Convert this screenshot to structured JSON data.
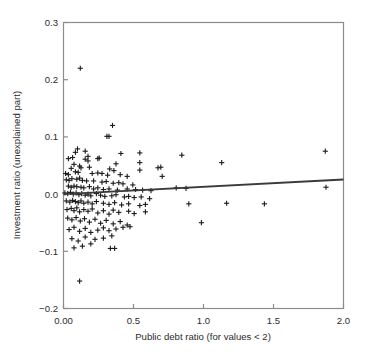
{
  "chart_data": {
    "type": "scatter",
    "title": "",
    "xlabel": "Public debt ratio (for values < 2)",
    "ylabel": "Investment ratio (unexplained part)",
    "xlim": [
      0.0,
      2.0
    ],
    "ylim": [
      -0.2,
      0.3
    ],
    "grid": false,
    "legend": null,
    "xticks": [
      0.0,
      0.5,
      1.0,
      1.5,
      2.0
    ],
    "xticklabels": [
      "0.00",
      "0.5",
      "1.0",
      "1.5",
      "2.0"
    ],
    "yticks": [
      -0.2,
      -0.1,
      0.0,
      0.1,
      0.2,
      0.3
    ],
    "yticklabels": [
      "-0.2",
      "-0.1",
      "0.0",
      "0.1",
      "0.2",
      "0.3"
    ],
    "marker": "plus",
    "marker_color": "#1a1a1a",
    "frame_color": "#8c8c8c",
    "series": [
      {
        "name": "observations",
        "points": [
          [
            0.12,
            0.22
          ],
          [
            0.35,
            0.12
          ],
          [
            0.31,
            0.101
          ],
          [
            0.325,
            0.101
          ],
          [
            0.085,
            0.073
          ],
          [
            0.1,
            0.079
          ],
          [
            0.155,
            0.075
          ],
          [
            0.175,
            0.066
          ],
          [
            0.41,
            0.071
          ],
          [
            0.545,
            0.072
          ],
          [
            0.845,
            0.068
          ],
          [
            1.87,
            0.075
          ],
          [
            0.035,
            0.062
          ],
          [
            0.065,
            0.064
          ],
          [
            0.155,
            0.061
          ],
          [
            0.175,
            0.058
          ],
          [
            0.245,
            0.062
          ],
          [
            0.255,
            0.063
          ],
          [
            0.375,
            0.053
          ],
          [
            0.545,
            0.055
          ],
          [
            1.13,
            0.055
          ],
          [
            0.055,
            0.045
          ],
          [
            0.075,
            0.052
          ],
          [
            0.115,
            0.049
          ],
          [
            0.125,
            0.046
          ],
          [
            0.185,
            0.047
          ],
          [
            0.33,
            0.044
          ],
          [
            0.36,
            0.041
          ],
          [
            0.545,
            0.042
          ],
          [
            0.675,
            0.046
          ],
          [
            0.695,
            0.047
          ],
          [
            0.015,
            0.036
          ],
          [
            0.035,
            0.034
          ],
          [
            0.085,
            0.039
          ],
          [
            0.105,
            0.038
          ],
          [
            0.205,
            0.036
          ],
          [
            0.245,
            0.037
          ],
          [
            0.275,
            0.036
          ],
          [
            0.315,
            0.033
          ],
          [
            0.405,
            0.034
          ],
          [
            0.455,
            0.031
          ],
          [
            0.705,
            0.031
          ],
          [
            0.02,
            0.025
          ],
          [
            0.04,
            0.024
          ],
          [
            0.06,
            0.027
          ],
          [
            0.095,
            0.026
          ],
          [
            0.115,
            0.028
          ],
          [
            0.135,
            0.024
          ],
          [
            0.165,
            0.023
          ],
          [
            0.215,
            0.023
          ],
          [
            0.275,
            0.021
          ],
          [
            0.305,
            0.022
          ],
          [
            0.355,
            0.019
          ],
          [
            0.395,
            0.02
          ],
          [
            0.425,
            0.018
          ],
          [
            0.495,
            0.016
          ],
          [
            0.035,
            0.014
          ],
          [
            0.055,
            0.012
          ],
          [
            0.075,
            0.014
          ],
          [
            0.095,
            0.013
          ],
          [
            0.125,
            0.012
          ],
          [
            0.145,
            0.011
          ],
          [
            0.185,
            0.013
          ],
          [
            0.215,
            0.009
          ],
          [
            0.245,
            0.011
          ],
          [
            0.285,
            0.008
          ],
          [
            0.325,
            0.009
          ],
          [
            0.385,
            0.007
          ],
          [
            0.455,
            0.009
          ],
          [
            0.515,
            0.008
          ],
          [
            0.565,
            0.007
          ],
          [
            0.625,
            0.006
          ],
          [
            0.805,
            0.011
          ],
          [
            0.875,
            0.01
          ],
          [
            1.875,
            0.012
          ],
          [
            0.01,
            0.002
          ],
          [
            0.03,
            0.001
          ],
          [
            0.05,
            0.003
          ],
          [
            0.07,
            0.0
          ],
          [
            0.09,
            0.002
          ],
          [
            0.11,
            -0.001
          ],
          [
            0.13,
            0.001
          ],
          [
            0.155,
            -0.002
          ],
          [
            0.175,
            0.0
          ],
          [
            0.195,
            -0.003
          ],
          [
            0.235,
            0.001
          ],
          [
            0.265,
            -0.002
          ],
          [
            0.295,
            -0.004
          ],
          [
            0.345,
            -0.003
          ],
          [
            0.375,
            -0.001
          ],
          [
            0.435,
            -0.005
          ],
          [
            0.465,
            -0.004
          ],
          [
            0.505,
            -0.006
          ],
          [
            0.555,
            -0.005
          ],
          [
            0.615,
            -0.008
          ],
          [
            0.02,
            -0.012
          ],
          [
            0.045,
            -0.014
          ],
          [
            0.065,
            -0.011
          ],
          [
            0.085,
            -0.013
          ],
          [
            0.105,
            -0.015
          ],
          [
            0.125,
            -0.012
          ],
          [
            0.145,
            -0.016
          ],
          [
            0.175,
            -0.014
          ],
          [
            0.205,
            -0.017
          ],
          [
            0.235,
            -0.013
          ],
          [
            0.285,
            -0.016
          ],
          [
            0.325,
            -0.018
          ],
          [
            0.365,
            -0.015
          ],
          [
            0.415,
            -0.019
          ],
          [
            0.465,
            -0.017
          ],
          [
            0.545,
            -0.02
          ],
          [
            0.585,
            -0.018
          ],
          [
            0.895,
            -0.017
          ],
          [
            1.165,
            -0.016
          ],
          [
            1.435,
            -0.017
          ],
          [
            0.025,
            -0.027
          ],
          [
            0.055,
            -0.025
          ],
          [
            0.075,
            -0.029
          ],
          [
            0.095,
            -0.024
          ],
          [
            0.115,
            -0.031
          ],
          [
            0.145,
            -0.027
          ],
          [
            0.175,
            -0.03
          ],
          [
            0.205,
            -0.026
          ],
          [
            0.245,
            -0.033
          ],
          [
            0.285,
            -0.029
          ],
          [
            0.325,
            -0.035
          ],
          [
            0.355,
            -0.028
          ],
          [
            0.395,
            -0.032
          ],
          [
            0.465,
            -0.03
          ],
          [
            0.505,
            -0.034
          ],
          [
            0.585,
            -0.031
          ],
          [
            0.03,
            -0.042
          ],
          [
            0.06,
            -0.045
          ],
          [
            0.09,
            -0.041
          ],
          [
            0.12,
            -0.047
          ],
          [
            0.15,
            -0.043
          ],
          [
            0.185,
            -0.049
          ],
          [
            0.225,
            -0.044
          ],
          [
            0.265,
            -0.051
          ],
          [
            0.305,
            -0.046
          ],
          [
            0.355,
            -0.052
          ],
          [
            0.405,
            -0.048
          ],
          [
            0.455,
            -0.054
          ],
          [
            0.985,
            -0.05
          ],
          [
            0.04,
            -0.062
          ],
          [
            0.075,
            -0.058
          ],
          [
            0.115,
            -0.065
          ],
          [
            0.155,
            -0.06
          ],
          [
            0.195,
            -0.067
          ],
          [
            0.245,
            -0.063
          ],
          [
            0.285,
            -0.059
          ],
          [
            0.325,
            -0.064
          ],
          [
            0.375,
            -0.061
          ],
          [
            0.425,
            -0.058
          ],
          [
            0.475,
            -0.057
          ],
          [
            0.06,
            -0.078
          ],
          [
            0.105,
            -0.082
          ],
          [
            0.155,
            -0.075
          ],
          [
            0.225,
            -0.079
          ],
          [
            0.285,
            -0.077
          ],
          [
            0.345,
            -0.073
          ],
          [
            0.075,
            -0.094
          ],
          [
            0.135,
            -0.091
          ],
          [
            0.195,
            -0.087
          ],
          [
            0.335,
            -0.095
          ],
          [
            0.365,
            -0.095
          ],
          [
            0.115,
            -0.152
          ]
        ]
      }
    ],
    "trendline": {
      "name": "regression-line",
      "color": "#3a3a3a",
      "x_start": 0.0,
      "y_start": 0.0,
      "x_end": 2.0,
      "y_end": 0.0255
    }
  }
}
